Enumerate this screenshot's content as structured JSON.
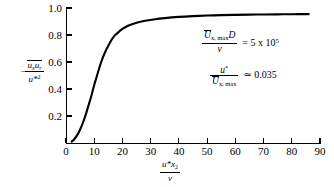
{
  "chart_data": {
    "type": "line",
    "title": "",
    "xlabel": "u*x2/v",
    "ylabel": "-(ux ur)/u*2",
    "xlim": [
      0,
      90
    ],
    "ylim": [
      0,
      1.0
    ],
    "grid": false,
    "legend_position": "none",
    "x_ticks": [
      "0",
      "10",
      "20",
      "30",
      "40",
      "50",
      "60",
      "70",
      "80",
      "90"
    ],
    "x_tick_values": [
      0,
      10,
      20,
      30,
      40,
      50,
      60,
      70,
      80,
      90
    ],
    "y_ticks": [
      "0.2",
      "0.4",
      "0.6",
      "0.8",
      "1.0"
    ],
    "y_tick_values": [
      0.2,
      0.4,
      0.6,
      0.8,
      1.0
    ],
    "series": [
      {
        "name": "Reynolds shear stress profile",
        "color": "#000000",
        "x": [
          2,
          3,
          4,
          5,
          6,
          7,
          8,
          9,
          10,
          11,
          12,
          13,
          14,
          15,
          16,
          17,
          18,
          20,
          22,
          25,
          28,
          31,
          35,
          40,
          45,
          50,
          55,
          60,
          65,
          70,
          75,
          80,
          86
        ],
        "y": [
          0.01,
          0.03,
          0.06,
          0.1,
          0.15,
          0.21,
          0.28,
          0.35,
          0.43,
          0.5,
          0.57,
          0.63,
          0.68,
          0.72,
          0.76,
          0.79,
          0.81,
          0.845,
          0.868,
          0.89,
          0.905,
          0.915,
          0.925,
          0.934,
          0.94,
          0.944,
          0.947,
          0.949,
          0.951,
          0.952,
          0.953,
          0.954,
          0.955
        ]
      }
    ],
    "annotations": [
      {
        "name": "reynolds-number",
        "numerator": "Ux, max D",
        "denominator": "v",
        "relation": "= 5 x 10",
        "exponent": "5"
      },
      {
        "name": "friction-velocity-ratio",
        "numerator": "u*",
        "denominator": "Ux, max",
        "relation": "≃ 0.035"
      }
    ]
  },
  "axis_titles": {
    "y": {
      "sign": "−",
      "numerator_part1": "u",
      "numerator_sub1": "x",
      "numerator_part2": "u",
      "numerator_sub2": "r",
      "denominator": "u*",
      "denominator_sup": "2"
    },
    "x": {
      "numerator_part1": "u*",
      "numerator_part2": "x",
      "numerator_sub": "2",
      "denominator": "v"
    }
  },
  "annotations_text": {
    "reynolds": {
      "num_main": "U",
      "num_sub": "x, max",
      "num_tail": "D",
      "den": "v",
      "relation": "= 5 x 10",
      "exponent": "5"
    },
    "friction": {
      "num_main": "u",
      "num_sup": "*",
      "den_main": "U",
      "den_sub": "x, max",
      "relation": "≃ 0.035"
    }
  }
}
